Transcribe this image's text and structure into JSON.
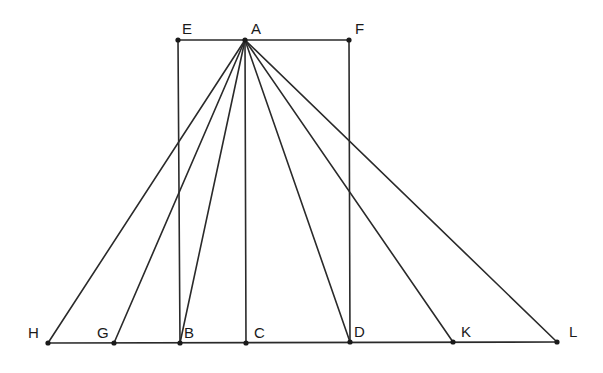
{
  "figure": {
    "points": [
      {
        "id": "A",
        "label": "A"
      },
      {
        "id": "E",
        "label": "E"
      },
      {
        "id": "F",
        "label": "F"
      },
      {
        "id": "H",
        "label": "H"
      },
      {
        "id": "G",
        "label": "G"
      },
      {
        "id": "B",
        "label": "B"
      },
      {
        "id": "C",
        "label": "C"
      },
      {
        "id": "D",
        "label": "D"
      },
      {
        "id": "K",
        "label": "K"
      },
      {
        "id": "L",
        "label": "L"
      }
    ],
    "segments": [
      [
        "E",
        "F"
      ],
      [
        "H",
        "L"
      ],
      [
        "E",
        "B"
      ],
      [
        "F",
        "D"
      ],
      [
        "A",
        "H"
      ],
      [
        "A",
        "G"
      ],
      [
        "A",
        "B"
      ],
      [
        "A",
        "C"
      ],
      [
        "A",
        "D"
      ],
      [
        "A",
        "K"
      ],
      [
        "A",
        "L"
      ]
    ]
  }
}
